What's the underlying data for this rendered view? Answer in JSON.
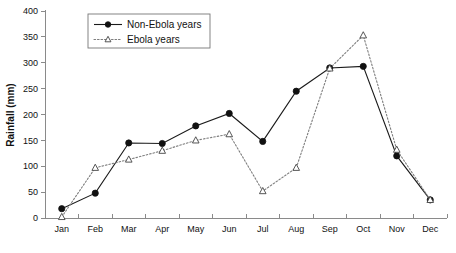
{
  "chart_data": {
    "type": "line",
    "title": "",
    "xlabel": "",
    "ylabel": "Rainfall (mm)",
    "ylim": [
      0,
      400
    ],
    "ytick_step": 50,
    "yticks": [
      0,
      50,
      100,
      150,
      200,
      250,
      300,
      350,
      400
    ],
    "ytick_labels": [
      "0",
      "50",
      "100",
      "150",
      "200",
      "250",
      "300",
      "350",
      "400"
    ],
    "grid": false,
    "legend_position": "top-left-inside",
    "categories": [
      "Jan",
      "Feb",
      "Mar",
      "Apr",
      "May",
      "Jun",
      "Jul",
      "Aug",
      "Sep",
      "Oct",
      "Nov",
      "Dec"
    ],
    "series": [
      {
        "name": "Non-Ebola years",
        "marker": "filled-circle",
        "line_style": "solid",
        "color": "#1a1a1a",
        "values": [
          18,
          48,
          145,
          144,
          178,
          202,
          148,
          245,
          290,
          293,
          120,
          35
        ]
      },
      {
        "name": "Ebola years",
        "marker": "open-triangle",
        "line_style": "dotted",
        "color": "#7d7d7d",
        "values": [
          2,
          97,
          113,
          130,
          150,
          162,
          52,
          97,
          289,
          353,
          132,
          35
        ]
      }
    ]
  },
  "axes": {
    "y_axis_title": "Rainfall (mm)"
  },
  "legend": {
    "entries": [
      {
        "label": "Non-Ebola years"
      },
      {
        "label": "Ebola years"
      }
    ]
  }
}
